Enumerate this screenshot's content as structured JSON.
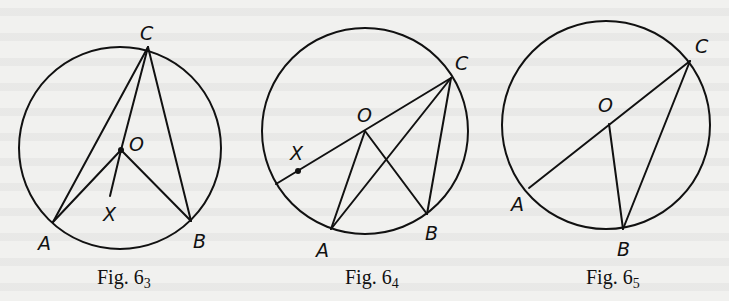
{
  "figures": [
    {
      "id": "fig63",
      "caption_prefix": "Fig. 6",
      "caption_sub": "3",
      "circle": {
        "cx": 120,
        "cy": 148,
        "r": 101
      },
      "points": {
        "C": {
          "x": 148,
          "y": 47,
          "label": "C",
          "lx": 140,
          "ly": 40
        },
        "O": {
          "x": 121,
          "y": 150,
          "label": "O",
          "lx": 129,
          "ly": 151
        },
        "A": {
          "x": 53,
          "y": 222,
          "label": "A",
          "lx": 38,
          "ly": 250
        },
        "B": {
          "x": 191,
          "y": 221,
          "label": "B",
          "lx": 193,
          "ly": 248
        },
        "X": {
          "x": 110,
          "y": 196,
          "label": "X",
          "lx": 103,
          "ly": 221
        }
      },
      "segments": [
        [
          "C",
          "A"
        ],
        [
          "C",
          "B"
        ],
        [
          "C",
          "O"
        ],
        [
          "O",
          "A"
        ],
        [
          "O",
          "B"
        ],
        [
          "O",
          "X"
        ]
      ],
      "dots": [
        "O"
      ]
    },
    {
      "id": "fig64",
      "caption_prefix": "Fig. 6",
      "caption_sub": "4",
      "circle": {
        "cx": 365,
        "cy": 131,
        "r": 103
      },
      "points": {
        "C": {
          "x": 451,
          "y": 78,
          "label": "C",
          "lx": 455,
          "ly": 70
        },
        "O": {
          "x": 365,
          "y": 131,
          "label": "O",
          "lx": 357,
          "ly": 122
        },
        "A": {
          "x": 331,
          "y": 229,
          "label": "A",
          "lx": 316,
          "ly": 257
        },
        "B": {
          "x": 427,
          "y": 214,
          "label": "B",
          "lx": 425,
          "ly": 240
        },
        "X": {
          "x": 298,
          "y": 171,
          "label": "X",
          "lx": 290,
          "ly": 160
        },
        "D": {
          "x": 276,
          "y": 184,
          "label": "",
          "lx": 0,
          "ly": 0
        }
      },
      "segments": [
        [
          "C",
          "D"
        ],
        [
          "C",
          "A"
        ],
        [
          "C",
          "B"
        ],
        [
          "O",
          "A"
        ],
        [
          "O",
          "B"
        ]
      ],
      "dots": [
        "X"
      ]
    },
    {
      "id": "fig65",
      "caption_prefix": "Fig. 6",
      "caption_sub": "5",
      "circle": {
        "cx": 606,
        "cy": 125,
        "r": 104
      },
      "points": {
        "C": {
          "x": 690,
          "y": 61,
          "label": "C",
          "lx": 695,
          "ly": 53
        },
        "O": {
          "x": 609,
          "y": 124,
          "label": "O",
          "lx": 598,
          "ly": 112
        },
        "A": {
          "x": 529,
          "y": 188,
          "label": "A",
          "lx": 511,
          "ly": 211
        },
        "B": {
          "x": 623,
          "y": 229,
          "label": "B",
          "lx": 617,
          "ly": 256
        }
      },
      "segments": [
        [
          "C",
          "A"
        ],
        [
          "O",
          "B"
        ],
        [
          "C",
          "B"
        ]
      ],
      "dots": []
    }
  ],
  "captions": {
    "fig63": {
      "text": "Fig. 6",
      "sub": "3"
    },
    "fig64": {
      "text": "Fig. 6",
      "sub": "4"
    },
    "fig65": {
      "text": "Fig. 6",
      "sub": "5"
    }
  },
  "colors": {
    "ink": "#111111",
    "paper": "#f1f1ef"
  }
}
